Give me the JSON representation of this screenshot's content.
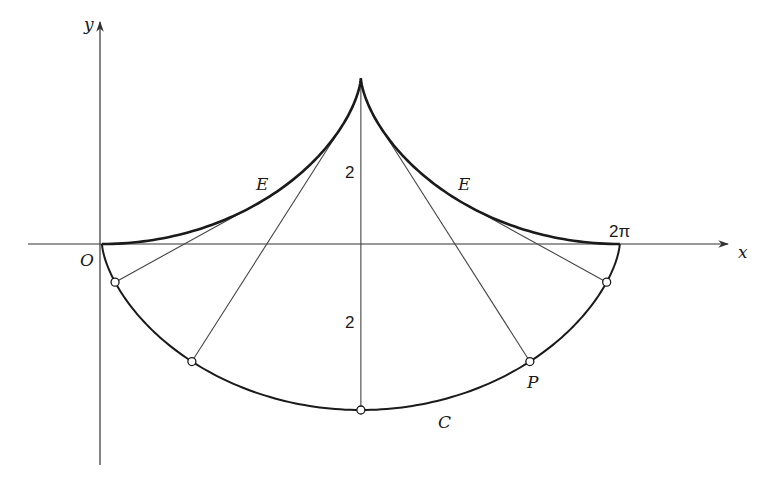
{
  "diagram": {
    "labels": {
      "x_axis": "x",
      "y_axis": "y",
      "origin": "O",
      "two_pi": "2π",
      "evolute_left": "E",
      "evolute_right": "E",
      "cycloid": "C",
      "point": "P",
      "height_upper": "2",
      "height_lower": "2"
    },
    "colors": {
      "stroke": "#1a1a1a",
      "axis": "#333333",
      "thin_line": "#444444",
      "background": "#ffffff"
    }
  },
  "chart_data": {
    "type": "diagram",
    "cycloid_C": {
      "param": "x = t - sin t, y = -(1 - cos t)",
      "t_range": [
        0,
        6.2832
      ]
    },
    "evolute_E": {
      "param": "x = t + sin t, y = 1 - cos t",
      "t_range": [
        0,
        6.2832
      ]
    },
    "marked_t_values": [
      1.0,
      2.0,
      3.1416,
      4.2832,
      5.2832
    ],
    "point_P_t": 4.2832,
    "x_ticks": [
      {
        "value": 6.2832,
        "label": "2π"
      }
    ],
    "annotations": [
      {
        "text": "2",
        "meaning": "height of E cusp above axis"
      },
      {
        "text": "2",
        "meaning": "depth of C below axis"
      }
    ]
  }
}
